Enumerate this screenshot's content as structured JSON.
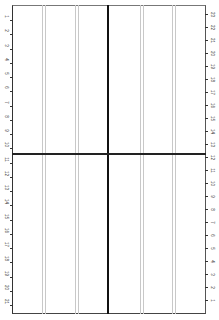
{
  "diagram": {
    "type": "grid-template",
    "frame": {
      "left": 12,
      "top": 5,
      "right": 206,
      "bottom": 314
    },
    "center_vertical_x": 108,
    "center_horizontal_y": 154,
    "light_line_pairs_x": [
      [
        42,
        45
      ],
      [
        75,
        78
      ],
      [
        140,
        143
      ],
      [
        172,
        175
      ]
    ],
    "colors": {
      "frame": "#333333",
      "center_lines": "#111111",
      "light_lines": "#c8c8c8"
    }
  },
  "left_axis": {
    "labels": [
      "1",
      "2",
      "3",
      "4",
      "5",
      "6",
      "7",
      "8",
      "9",
      "10",
      "11",
      "12",
      "13",
      "14",
      "15",
      "16",
      "17",
      "18",
      "19",
      "20",
      "21"
    ]
  },
  "right_axis": {
    "labels": [
      "23",
      "22",
      "21",
      "20",
      "19",
      "18",
      "17",
      "16",
      "15",
      "14",
      "13",
      "12",
      "11",
      "10",
      "9",
      "8",
      "7",
      "6",
      "5",
      "4",
      "3",
      "2",
      "1"
    ]
  }
}
